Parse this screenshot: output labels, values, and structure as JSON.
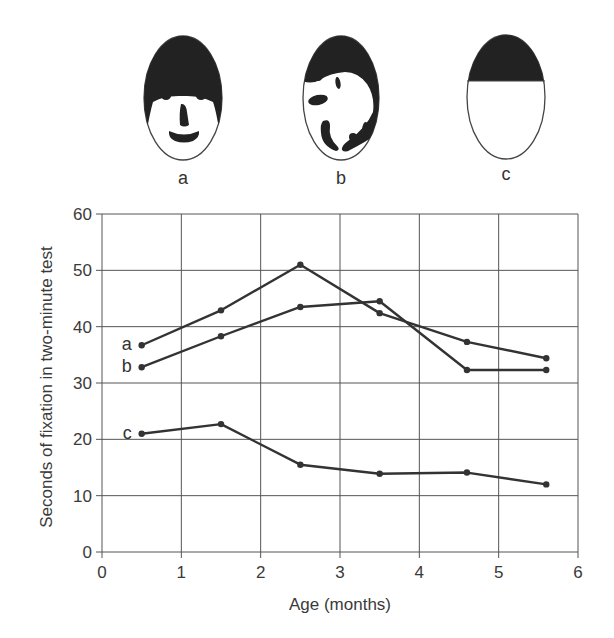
{
  "faces": [
    {
      "id": "a",
      "label": "a",
      "description": "schematic face with features"
    },
    {
      "id": "b",
      "label": "b",
      "description": "scrambled features"
    },
    {
      "id": "c",
      "label": "c",
      "description": "blank face with hair only"
    }
  ],
  "chart_data": {
    "type": "line",
    "title": "",
    "xlabel": "Age (months)",
    "ylabel": "Seconds of fixation in two-minute test",
    "xlim": [
      0,
      6
    ],
    "ylim": [
      0,
      60
    ],
    "xticks": [
      0,
      1,
      2,
      3,
      4,
      5,
      6
    ],
    "yticks": [
      0,
      10,
      20,
      30,
      40,
      50,
      60
    ],
    "grid": true,
    "legend": "inline labels at left of each line",
    "x": [
      0.5,
      1.5,
      2.5,
      3.5,
      4.6,
      5.6
    ],
    "series": [
      {
        "name": "a",
        "values": [
          36.7,
          42.9,
          51.0,
          42.4,
          37.3,
          34.4
        ]
      },
      {
        "name": "b",
        "values": [
          32.8,
          38.3,
          43.5,
          44.5,
          32.3,
          32.3
        ]
      },
      {
        "name": "c",
        "values": [
          21.0,
          22.7,
          15.5,
          13.9,
          14.1,
          12.0
        ]
      }
    ]
  }
}
